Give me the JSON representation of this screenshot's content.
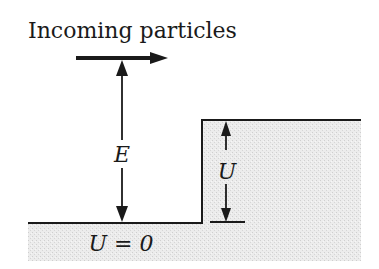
{
  "diagram": {
    "title": "Incoming particles",
    "energy_label": "E",
    "step_label": "U",
    "ground_label": "U = 0",
    "colors": {
      "ink": "#1a1a1a",
      "fill": "#e4e4e4",
      "background": "#ffffff"
    }
  }
}
